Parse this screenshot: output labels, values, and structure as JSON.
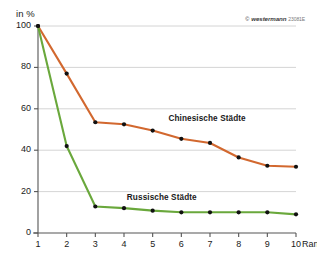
{
  "credit": {
    "mark": "©",
    "brand": "westermann",
    "code": "23081E"
  },
  "axis": {
    "y_unit_label": "in %",
    "x_axis_name": "Rang"
  },
  "chart_data": {
    "type": "line",
    "title": "",
    "subtitle": "",
    "xlabel": "Rang",
    "ylabel": "in %",
    "xlim": [
      1,
      10
    ],
    "ylim": [
      0,
      100
    ],
    "grid": true,
    "grid_axis": "y",
    "legend_position": "inline-annotation",
    "x": [
      1,
      2,
      3,
      4,
      5,
      6,
      7,
      8,
      9,
      10
    ],
    "xticklabels": [
      "1",
      "2",
      "3",
      "4",
      "5",
      "6",
      "7",
      "8",
      "9",
      "10"
    ],
    "yticks": [
      0,
      20,
      40,
      60,
      80,
      100
    ],
    "yticklabels": [
      "0",
      "20",
      "40",
      "60",
      "80",
      "100"
    ],
    "series": [
      {
        "name": "Chinesische Städte",
        "color": "#d2682f",
        "marker": "circle",
        "marker_color": "#111111",
        "values": [
          100,
          77,
          53.5,
          52.5,
          49.5,
          45.5,
          43.5,
          36.5,
          32.5,
          32
        ]
      },
      {
        "name": "Russische Städte",
        "color": "#6aa83c",
        "marker": "circle",
        "marker_color": "#111111",
        "values": [
          100,
          42,
          12.8,
          12,
          10.8,
          10,
          10,
          10,
          10,
          9
        ]
      }
    ],
    "annotations": [
      {
        "text": "Chinesische Städte",
        "x": 5.55,
        "y": 55
      },
      {
        "text": "Russische Städte",
        "x": 4.1,
        "y": 17
      }
    ]
  },
  "colors": {
    "chinese_series": "#d2682f",
    "russian_series": "#6aa83c",
    "gridline": "#c9c9c9",
    "axis": "#555555",
    "marker": "#111111",
    "background": "#ffffff"
  }
}
